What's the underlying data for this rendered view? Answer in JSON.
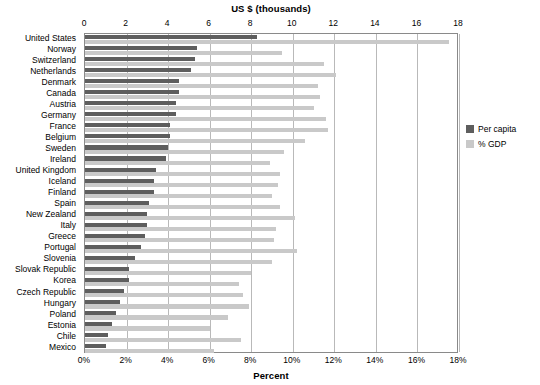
{
  "chart_data": {
    "type": "bar",
    "orientation": "horizontal",
    "title": "",
    "xlabel": "US $ (thousands)",
    "xlabel_secondary": "Percent",
    "ylabel": "",
    "grid": true,
    "legend_position": "right",
    "top_axis": {
      "label": "US $ (thousands)",
      "ticks": [
        0,
        2,
        4,
        6,
        8,
        10,
        12,
        14,
        16,
        18
      ],
      "tick_labels": [
        "0",
        "2",
        "4",
        "6",
        "8",
        "10",
        "12",
        "14",
        "16",
        "18"
      ],
      "range": [
        0,
        18
      ]
    },
    "bottom_axis": {
      "label": "Percent",
      "ticks": [
        0,
        2,
        4,
        6,
        8,
        10,
        12,
        14,
        16,
        18
      ],
      "tick_labels": [
        "0%",
        "2%",
        "4%",
        "6%",
        "8%",
        "10%",
        "12%",
        "14%",
        "16%",
        "18%"
      ],
      "range": [
        0,
        18
      ]
    },
    "categories": [
      "United States",
      "Norway",
      "Switzerland",
      "Netherlands",
      "Denmark",
      "Canada",
      "Austria",
      "Germany",
      "France",
      "Belgium",
      "Sweden",
      "Ireland",
      "United Kingdom",
      "Iceland",
      "Finland",
      "Spain",
      "New Zealand",
      "Italy",
      "Greece",
      "Portugal",
      "Slovenia",
      "Slovak Republic",
      "Korea",
      "Czech Republic",
      "Hungary",
      "Poland",
      "Estonia",
      "Chile",
      "Mexico"
    ],
    "series": [
      {
        "name": "Per capita",
        "axis": "top",
        "unit": "US $ (thousands)",
        "color": "#5e5e5e",
        "values": [
          8.3,
          5.4,
          5.3,
          5.1,
          4.5,
          4.5,
          4.4,
          4.4,
          4.1,
          4.1,
          4.0,
          3.9,
          3.4,
          3.3,
          3.3,
          3.1,
          3.0,
          3.0,
          2.9,
          2.7,
          2.4,
          2.1,
          2.1,
          1.9,
          1.7,
          1.5,
          1.3,
          1.1,
          1.0
        ]
      },
      {
        "name": "% GDP",
        "axis": "bottom",
        "unit": "Percent",
        "color": "#c9c9c9",
        "values": [
          17.5,
          9.5,
          11.5,
          12.1,
          11.2,
          11.3,
          11.0,
          11.6,
          11.7,
          10.6,
          9.6,
          8.9,
          9.4,
          9.3,
          9.0,
          9.4,
          10.1,
          9.2,
          9.1,
          10.2,
          9.0,
          8.0,
          7.4,
          7.6,
          7.9,
          6.9,
          6.0,
          7.5,
          6.2
        ]
      }
    ]
  },
  "legend": {
    "items": [
      {
        "label": "Per capita",
        "color": "#5e5e5e"
      },
      {
        "label": "% GDP",
        "color": "#c9c9c9"
      }
    ]
  }
}
